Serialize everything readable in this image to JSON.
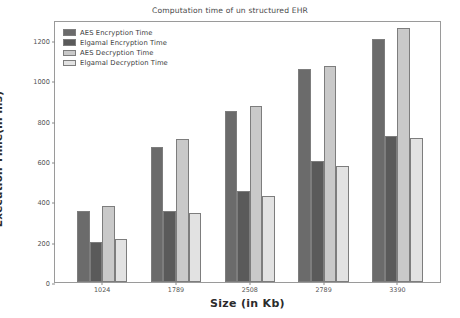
{
  "chart_data": {
    "type": "bar",
    "title": "Computation time of un structured EHR",
    "xlabel": "Size (in Kb)",
    "ylabel": "Execution Time(in ms)",
    "categories": [
      "1024",
      "1789",
      "2508",
      "2789",
      "3390"
    ],
    "yticks": [
      "0",
      "200",
      "400",
      "600",
      "800",
      "1000",
      "1200"
    ],
    "ylim": [
      0,
      1300
    ],
    "grid": false,
    "legend_position": "upper left",
    "series": [
      {
        "name": "AES Encryption Time",
        "color": "#6b6b6b",
        "values": [
          350,
          670,
          850,
          1055,
          1205
        ]
      },
      {
        "name": "Elgamal Encryption Time",
        "color": "#5a5a5a",
        "values": [
          200,
          350,
          450,
          600,
          725
        ]
      },
      {
        "name": "AES Decryption Time",
        "color": "#c9c9c9",
        "values": [
          378,
          710,
          875,
          1070,
          1260
        ]
      },
      {
        "name": "Elgamal Decryption Time",
        "color": "#e2e2e2",
        "values": [
          212,
          340,
          425,
          575,
          715
        ]
      }
    ]
  }
}
